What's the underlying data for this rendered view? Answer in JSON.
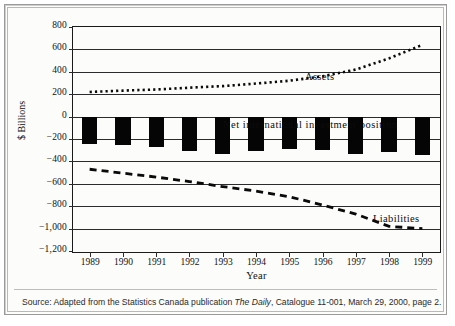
{
  "chart_data": {
    "type": "bar",
    "title": "",
    "xlabel": "Year",
    "ylabel": "$ Billions",
    "categories": [
      "1989",
      "1990",
      "1991",
      "1992",
      "1993",
      "1994",
      "1995",
      "1996",
      "1997",
      "1998",
      "1999"
    ],
    "ylim": [
      -1200,
      800
    ],
    "ytick_values": [
      800,
      600,
      400,
      200,
      0,
      -200,
      -400,
      -600,
      -800,
      -1000,
      -1200
    ],
    "ytick_labels": [
      "800",
      "600",
      "400",
      "200",
      "0",
      "−200",
      "−400",
      "−600",
      "−800",
      "−1,000",
      "−1,200"
    ],
    "grid": true,
    "legend_position": "inline-annotations",
    "series": [
      {
        "name": "Assets",
        "style": "dotted-line",
        "values": [
          220,
          232,
          242,
          258,
          272,
          295,
          320,
          360,
          420,
          520,
          640
        ]
      },
      {
        "name": "Net international investment position",
        "style": "bar",
        "values": [
          -245,
          -255,
          -268,
          -310,
          -330,
          -305,
          -290,
          -300,
          -330,
          -320,
          -345
        ]
      },
      {
        "name": "Liabilities",
        "style": "dashed-line",
        "values": [
          -470,
          -505,
          -540,
          -580,
          -625,
          -665,
          -715,
          -790,
          -870,
          -980,
          -1000
        ]
      }
    ],
    "annotations": [
      {
        "text": "Assets",
        "x": 1994.2,
        "y": 410
      },
      {
        "text": "Net international investment position",
        "x": 1991.4,
        "y": 90
      },
      {
        "text": "Liabilities",
        "x": 1996.2,
        "y": -700
      }
    ]
  },
  "source": {
    "prefix": "Source: Adapted from the Statistics Canada publication ",
    "italic": "The Daily",
    "suffix": ", Catalogue 11-001, March 29, 2000, page 2."
  }
}
